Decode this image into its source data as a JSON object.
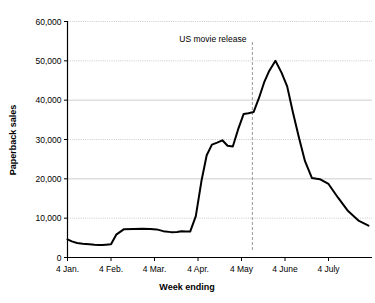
{
  "chart_data": {
    "type": "line",
    "title": "",
    "xlabel": "Week ending",
    "ylabel": "Paperback sales",
    "ylim": [
      0,
      60000
    ],
    "grid": true,
    "legend": "none",
    "y_ticks": [
      "0",
      "10,000",
      "20,000",
      "30,000",
      "40,000",
      "50,000",
      "60,000"
    ],
    "y_tick_values": [
      0,
      10000,
      20000,
      30000,
      40000,
      50000,
      60000
    ],
    "x_ticks": [
      "4 Jan.",
      "4 Feb.",
      "4 Mar.",
      "4 Apr.",
      "4 May",
      "4 June",
      "4 July"
    ],
    "x_tick_values": [
      0,
      1,
      2,
      3,
      4,
      5,
      6
    ],
    "annotations": [
      {
        "label": "US movie release",
        "x_value": 4.25,
        "type": "vertical-line-with-label"
      }
    ],
    "series": [
      {
        "name": "Paperback sales",
        "x": [
          0.0,
          0.1,
          0.22,
          0.35,
          0.5,
          0.62,
          0.72,
          0.8,
          0.88,
          1.0,
          1.12,
          1.3,
          1.52,
          1.72,
          1.9,
          2.05,
          2.2,
          2.38,
          2.52,
          2.62,
          2.72,
          2.82,
          2.95,
          3.08,
          3.2,
          3.32,
          3.44,
          3.56,
          3.68,
          3.8,
          3.92,
          4.05,
          4.16,
          4.28,
          4.4,
          4.52,
          4.64,
          4.78,
          4.92,
          5.05,
          5.18,
          5.32,
          5.46,
          5.62,
          5.8,
          6.0,
          6.22,
          6.45,
          6.7,
          6.92
        ],
        "y": [
          4600,
          4100,
          3700,
          3500,
          3350,
          3250,
          3200,
          3200,
          3250,
          3350,
          5800,
          7200,
          7250,
          7300,
          7250,
          7150,
          6700,
          6450,
          6500,
          6700,
          6600,
          6600,
          10500,
          19500,
          26000,
          28700,
          29200,
          29800,
          28400,
          28200,
          32500,
          36500,
          36700,
          37000,
          40500,
          44500,
          47500,
          50000,
          47000,
          43500,
          37000,
          30500,
          24500,
          20200,
          19900,
          18700,
          15200,
          11800,
          9300,
          8100
        ]
      }
    ]
  },
  "axes": {
    "y_axis_title": "Paperback sales",
    "x_axis_title": "Week ending"
  }
}
